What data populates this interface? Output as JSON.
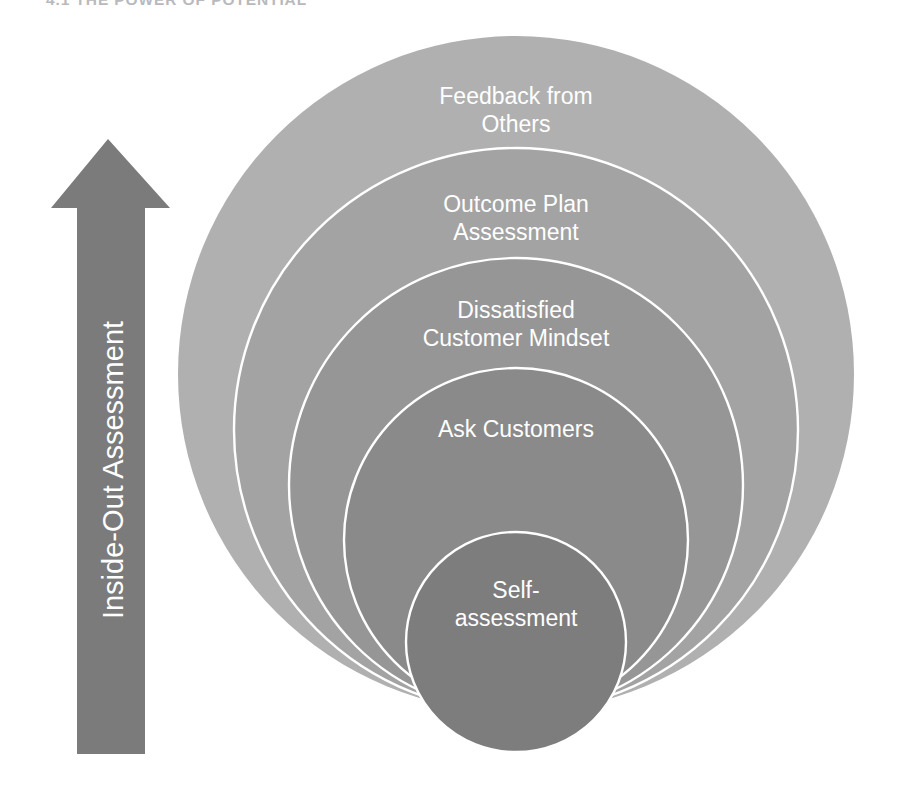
{
  "page": {
    "heading": "4.1 THE POWER OF POTENTIAL",
    "background_color": "#ffffff"
  },
  "arrow": {
    "label": "Inside-Out Assessment",
    "direction": "up",
    "fill_color": "#7b7b7b",
    "label_color": "#ffffff",
    "label_font_size": 29
  },
  "diagram": {
    "type": "nested-concentric-circles",
    "alignment": "bottom-tangent",
    "outline_color": "#ffffff",
    "label_color": "#ffffff",
    "rings": [
      {
        "id": "ring-1",
        "order": 1,
        "position": "outermost",
        "label": "Feedback from Others",
        "label_lines": [
          "Feedback from",
          "Others"
        ],
        "fill_color": "#b0b0b0",
        "radius": 338,
        "center_x": 516,
        "center_y": 374,
        "label_font_size": 23
      },
      {
        "id": "ring-2",
        "order": 2,
        "label": "Outcome Plan Assessment",
        "label_lines": [
          "Outcome Plan",
          "Assessment"
        ],
        "fill_color": "#a3a3a3",
        "radius": 282,
        "center_x": 516,
        "center_y": 430,
        "label_font_size": 23
      },
      {
        "id": "ring-3",
        "order": 3,
        "label": "Dissatisfied Customer Mindset",
        "label_lines": [
          "Dissatisfied",
          "Customer Mindset"
        ],
        "fill_color": "#969696",
        "radius": 227,
        "center_x": 516,
        "center_y": 485,
        "label_font_size": 23
      },
      {
        "id": "ring-4",
        "order": 4,
        "label": "Ask Customers",
        "label_lines": [
          "Ask Customers"
        ],
        "fill_color": "#8a8a8a",
        "radius": 172,
        "center_x": 516,
        "center_y": 540,
        "label_font_size": 23
      },
      {
        "id": "ring-5",
        "order": 5,
        "position": "innermost",
        "label": "Self-assessment",
        "label_lines": [
          "Self-",
          "assessment"
        ],
        "fill_color": "#7d7d7d",
        "radius": 110,
        "center_x": 516,
        "center_y": 642,
        "label_font_size": 23
      }
    ]
  }
}
